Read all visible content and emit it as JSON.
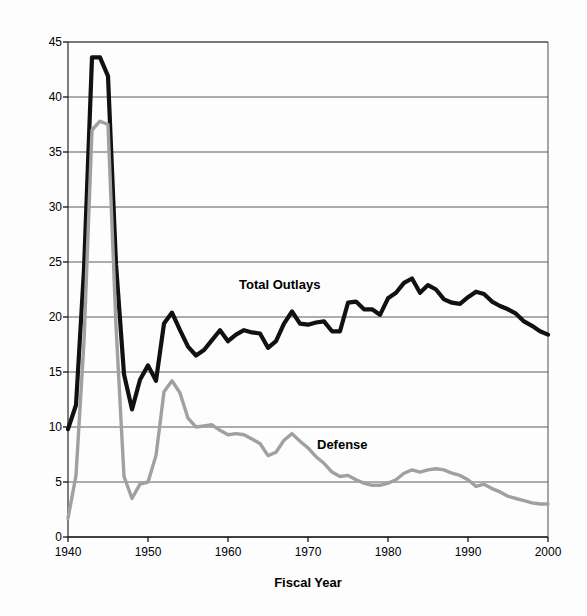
{
  "chart_data": {
    "type": "line",
    "title": "",
    "xlabel": "Fiscal Year",
    "ylabel": "Percent of GDP",
    "xlim": [
      1940,
      2000
    ],
    "ylim": [
      0,
      45
    ],
    "grid": true,
    "legend": "inline-annotations",
    "xticks": [
      "1940",
      "1950",
      "1960",
      "1970",
      "1980",
      "1990",
      "2000"
    ],
    "yticks": [
      "0",
      "5",
      "10",
      "15",
      "20",
      "25",
      "30",
      "35",
      "40",
      "45"
    ],
    "x": [
      1940,
      1941,
      1942,
      1943,
      1944,
      1945,
      1946,
      1947,
      1948,
      1949,
      1950,
      1951,
      1952,
      1953,
      1954,
      1955,
      1956,
      1957,
      1958,
      1959,
      1960,
      1961,
      1962,
      1963,
      1964,
      1965,
      1966,
      1967,
      1968,
      1969,
      1970,
      1971,
      1972,
      1973,
      1974,
      1975,
      1976,
      1977,
      1978,
      1979,
      1980,
      1981,
      1982,
      1983,
      1984,
      1985,
      1986,
      1987,
      1988,
      1989,
      1990,
      1991,
      1992,
      1993,
      1994,
      1995,
      1996,
      1997,
      1998,
      1999,
      2000
    ],
    "series": [
      {
        "name": "Total Outlays",
        "color": "#111111",
        "width": 4.2,
        "values": [
          9.8,
          12.0,
          24.3,
          43.6,
          43.6,
          41.9,
          24.8,
          14.8,
          11.6,
          14.3,
          15.6,
          14.2,
          19.4,
          20.4,
          18.8,
          17.3,
          16.5,
          17.0,
          17.9,
          18.8,
          17.8,
          18.4,
          18.8,
          18.6,
          18.5,
          17.2,
          17.8,
          19.4,
          20.5,
          19.4,
          19.3,
          19.5,
          19.6,
          18.7,
          18.7,
          21.3,
          21.4,
          20.7,
          20.7,
          20.2,
          21.7,
          22.2,
          23.1,
          23.5,
          22.2,
          22.9,
          22.5,
          21.6,
          21.3,
          21.2,
          21.8,
          22.3,
          22.1,
          21.4,
          21.0,
          20.7,
          20.3,
          19.6,
          19.2,
          18.7,
          18.4
        ]
      },
      {
        "name": "Defense",
        "color": "#a0a0a0",
        "width": 3.4,
        "values": [
          1.7,
          5.6,
          17.8,
          37.0,
          37.8,
          37.5,
          19.2,
          5.5,
          3.5,
          4.8,
          5.0,
          7.4,
          13.2,
          14.2,
          13.1,
          10.8,
          10.0,
          10.1,
          10.2,
          9.7,
          9.3,
          9.4,
          9.3,
          8.9,
          8.5,
          7.4,
          7.7,
          8.8,
          9.4,
          8.7,
          8.1,
          7.3,
          6.7,
          5.9,
          5.5,
          5.6,
          5.2,
          4.9,
          4.7,
          4.7,
          4.9,
          5.2,
          5.8,
          6.1,
          5.9,
          6.1,
          6.2,
          6.1,
          5.8,
          5.6,
          5.2,
          4.6,
          4.8,
          4.4,
          4.1,
          3.7,
          3.5,
          3.3,
          3.1,
          3.0,
          3.0
        ]
      }
    ],
    "annotations": [
      {
        "text": "Total Outlays",
        "x": 1966,
        "y": 23.5
      },
      {
        "text": "Defense",
        "x": 1976,
        "y": 8.0
      }
    ]
  },
  "axis": {
    "y_title": "Percent of GDP",
    "x_title": "Fiscal Year"
  },
  "labels": {
    "total_outlays": "Total Outlays",
    "defense": "Defense"
  }
}
